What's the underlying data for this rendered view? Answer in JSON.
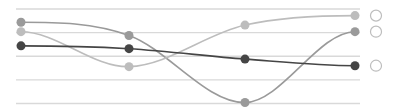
{
  "chart_data": {
    "type": "line",
    "smooth": true,
    "title": "",
    "xlabel": "",
    "ylabel": "",
    "categories": [
      "",
      "",
      "",
      ""
    ],
    "ylim": [
      0,
      100
    ],
    "grid": true,
    "gridlines": [
      0,
      25,
      50,
      75,
      100
    ],
    "legend_position": "right",
    "series": [
      {
        "name": "",
        "color": "#9a9a9a",
        "values": [
          86,
          72,
          1,
          76
        ]
      },
      {
        "name": "",
        "color": "#bdbdbd",
        "values": [
          76,
          39,
          83,
          93
        ]
      },
      {
        "name": "",
        "color": "#454545",
        "values": [
          61,
          58,
          47,
          40
        ]
      }
    ]
  },
  "layout": {
    "plot_left": 16,
    "plot_right": 360,
    "plot_top": 9,
    "plot_bottom": 103.5,
    "point_x": [
      21,
      129,
      245,
      355
    ],
    "legend_x": 376,
    "gridline_color": "#d9d9d9",
    "legend_stroke": "#bdbdbd"
  }
}
